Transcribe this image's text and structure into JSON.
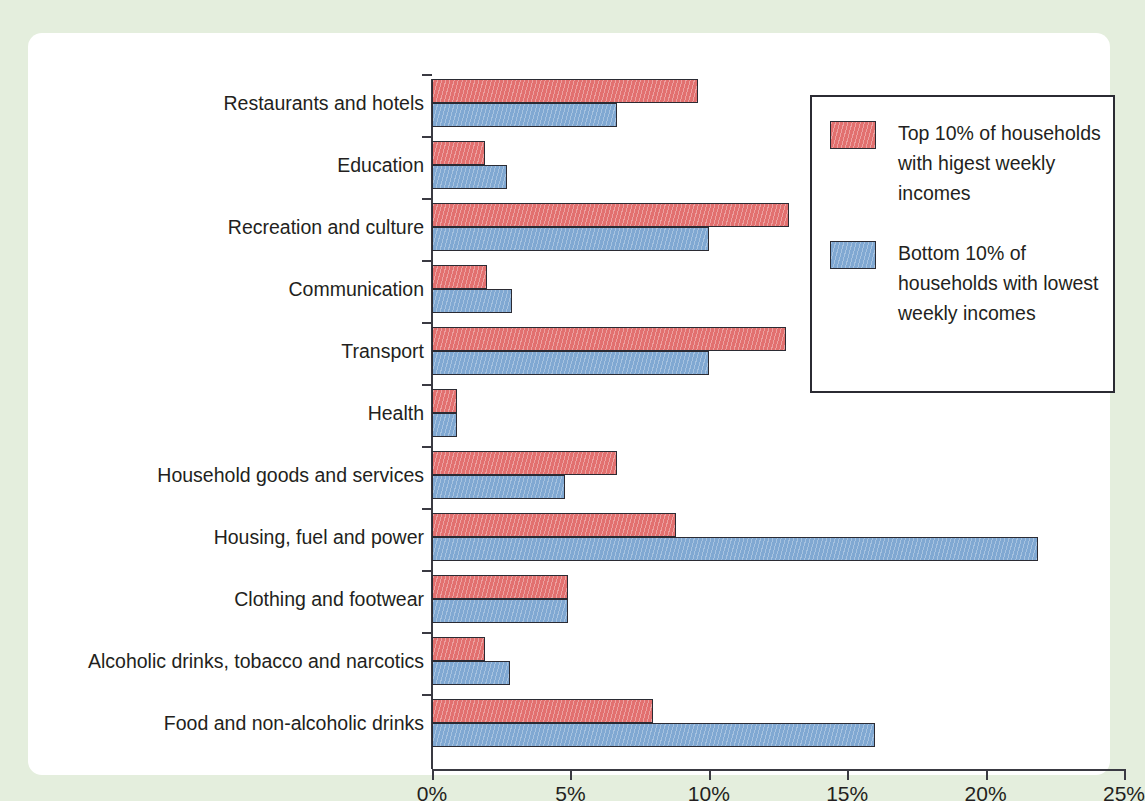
{
  "chart_data": {
    "type": "bar",
    "orientation": "horizontal",
    "title": "",
    "xlabel": "",
    "ylabel": "",
    "xlim": [
      0,
      25
    ],
    "xunit": "%",
    "grid": false,
    "legend_position": "top-right",
    "xticks": [
      "0%",
      "5%",
      "10%",
      "15%",
      "20%",
      "25%"
    ],
    "xtick_values": [
      0,
      5,
      10,
      15,
      20,
      25
    ],
    "categories": [
      "Restaurants and hotels",
      "Education",
      "Recreation and culture",
      "Communication",
      "Transport",
      "Health",
      "Household goods and services",
      "Housing, fuel and power",
      "Clothing and footwear",
      "Alcoholic drinks, tobacco and narcotics",
      "Food and non-alcoholic drinks"
    ],
    "series": [
      {
        "name": "Top 10% of households with higest weekly incomes",
        "color": "#e2706f",
        "values": [
          9.6,
          1.9,
          12.9,
          2.0,
          12.8,
          0.9,
          6.7,
          8.8,
          4.9,
          1.9,
          8.0
        ]
      },
      {
        "name": "Bottom 10% of households with lowest weekly incomes",
        "color": "#80a8d2",
        "values": [
          6.7,
          2.7,
          10.0,
          2.9,
          10.0,
          0.9,
          4.8,
          21.9,
          4.9,
          2.8,
          16.0
        ]
      }
    ]
  },
  "legend": {
    "entries": [
      {
        "label": "Top 10% of households with higest weekly incomes",
        "color": "#e2706f"
      },
      {
        "label": "Bottom 10% of households with lowest weekly incomes",
        "color": "#80a8d2"
      }
    ]
  },
  "colors": {
    "page_background": "#e4eedd",
    "card_background": "#ffffff",
    "axis": "#3a3a42",
    "text": "#231f20",
    "series_red": "#e2706f",
    "series_blue": "#80a8d2"
  }
}
